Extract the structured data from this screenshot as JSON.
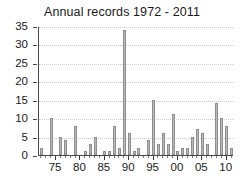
{
  "chart_data": {
    "type": "bar",
    "title": "Annual records 1972 - 2011",
    "xlabel": "",
    "ylabel": "",
    "ylim": [
      0,
      35
    ],
    "ytick_step": 5,
    "yticks": [
      0,
      5,
      10,
      15,
      20,
      25,
      30,
      35
    ],
    "ytick_labels": [
      "0",
      "5",
      "10",
      "15",
      "20",
      "25",
      "30",
      "35"
    ],
    "xlim": [
      1971.5,
      2011.5
    ],
    "xticks": [
      1975,
      1980,
      1985,
      1990,
      1995,
      2000,
      2005,
      2010
    ],
    "xtick_labels": [
      "75",
      "80",
      "85",
      "90",
      "95",
      "00",
      "05",
      "10"
    ],
    "grid": "horizontal-dotted",
    "legend": "none",
    "categories": [
      "1972",
      "1973",
      "1974",
      "1975",
      "1976",
      "1977",
      "1978",
      "1979",
      "1980",
      "1981",
      "1982",
      "1983",
      "1984",
      "1985",
      "1986",
      "1987",
      "1988",
      "1989",
      "1990",
      "1991",
      "1992",
      "1993",
      "1994",
      "1995",
      "1996",
      "1997",
      "1998",
      "1999",
      "2000",
      "2001",
      "2002",
      "2003",
      "2004",
      "2005",
      "2006",
      "2007",
      "2008",
      "2009",
      "2010",
      "2011"
    ],
    "values": [
      2,
      0,
      10,
      0,
      5,
      4,
      0,
      8,
      0,
      1,
      3,
      5,
      0,
      1,
      1,
      8,
      2,
      34,
      6,
      1,
      2,
      0,
      4,
      15,
      3,
      6,
      3,
      11,
      1,
      2,
      2,
      5,
      7,
      6,
      3,
      0,
      14,
      10,
      8,
      2
    ],
    "bar_color": "#b9b9b9",
    "bar_edge_color": "#8e8e8e",
    "axis_color": "#4a4a4a",
    "grid_color": "#c9c9c9",
    "text_color": "#1a1a1a",
    "background_color": "#ffffff"
  }
}
